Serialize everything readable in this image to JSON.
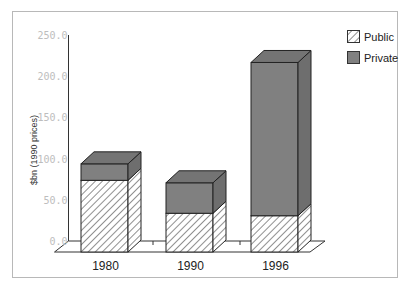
{
  "chart_data": {
    "type": "bar",
    "stacked": true,
    "style": "3d",
    "title": "",
    "xlabel": "",
    "ylabel": "$bn (1990 prices)",
    "ylim": [
      0,
      250
    ],
    "yticks": [
      "0.0",
      "50.0",
      "100.0",
      "150.0",
      "200.0",
      "250.0"
    ],
    "ytick_values": [
      0,
      50,
      100,
      150,
      200,
      250
    ],
    "categories": [
      "1980",
      "1990",
      "1996"
    ],
    "series": [
      {
        "name": "Public",
        "values": [
          87,
          47,
          44
        ],
        "pattern": "diagonal-hatch",
        "color": "#ffffff"
      },
      {
        "name": "Private",
        "values": [
          20,
          37,
          186
        ],
        "pattern": "solid",
        "color": "#808080"
      }
    ],
    "legend": {
      "position": "top-right",
      "entries": [
        "Public",
        "Private"
      ]
    },
    "grid": false
  }
}
